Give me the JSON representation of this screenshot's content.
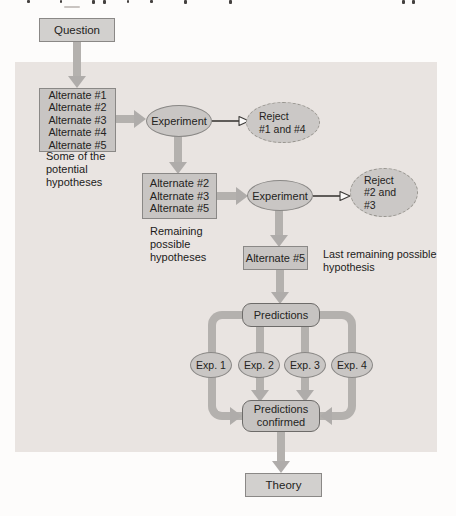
{
  "diagram": {
    "question": "Question",
    "hypotheses_initial": {
      "text": "Alternate #1\nAlternate #2\nAlternate #3\nAlternate #4\nAlternate #5",
      "caption": "Some of the\npotential\nhypotheses"
    },
    "experiment_1": "Experiment",
    "reject_1": "Reject\n#1 and #4",
    "hypotheses_remaining": {
      "text": "Alternate #2\nAlternate #3\nAlternate #5",
      "caption": "Remaining\npossible\nhypotheses"
    },
    "experiment_2": "Experiment",
    "reject_2": "Reject\n#2 and\n#3",
    "last_hypothesis": {
      "text": "Alternate #5",
      "caption": "Last remaining possible\nhypothesis"
    },
    "predictions": "Predictions",
    "experiments": [
      "Exp. 1",
      "Exp. 2",
      "Exp. 3",
      "Exp. 4"
    ],
    "predictions_confirmed": "Predictions\nconfirmed",
    "theory": "Theory"
  },
  "colors": {
    "panel_background": "#e9e4e1",
    "node_fill": "#c8c5c3",
    "node_border": "#8a8886",
    "rounded_border": "#6d6b69",
    "arrow_gray": "#b4b1ae",
    "text": "#242321"
  }
}
